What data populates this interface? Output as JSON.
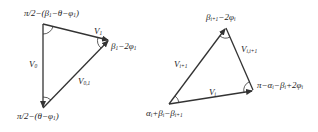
{
  "diagram": {
    "left_triangle": {
      "angles": {
        "top": {
          "main": "π/2−(β",
          "sub": "1",
          "rest": "−θ−φ",
          "sub2": "1",
          "end": ")"
        },
        "right": {
          "main": "β",
          "sub": "1",
          "rest": "−2φ",
          "sub2": "1"
        },
        "bottom": {
          "main": "π/2−(θ−φ",
          "sub": "1",
          "end": ")"
        }
      },
      "vectors": {
        "left": {
          "main": "V",
          "sub": "0"
        },
        "top": {
          "main": "V",
          "sub": "1"
        },
        "diag": {
          "main": "V",
          "sub": "0,1"
        }
      }
    },
    "right_triangle": {
      "angles": {
        "top": {
          "main": "β",
          "sub": "i+1",
          "rest": "−2φ",
          "sub2": "i"
        },
        "right": {
          "main": "π−α",
          "sub": "i",
          "rest": "−β",
          "sub2": "i",
          "end": "+2φ",
          "sub3": "i"
        },
        "bottom": {
          "main": "α",
          "sub": "i",
          "rest": "+β",
          "sub2": "i",
          "end": "−β",
          "sub3": "i+1"
        }
      },
      "vectors": {
        "left": {
          "main": "V",
          "sub": "i+1"
        },
        "right": {
          "main": "V",
          "sub": "i,i+1"
        },
        "bottom": {
          "main": "V",
          "sub": "i"
        }
      }
    },
    "colors": {
      "line": "#333333",
      "text": "#222222"
    }
  }
}
